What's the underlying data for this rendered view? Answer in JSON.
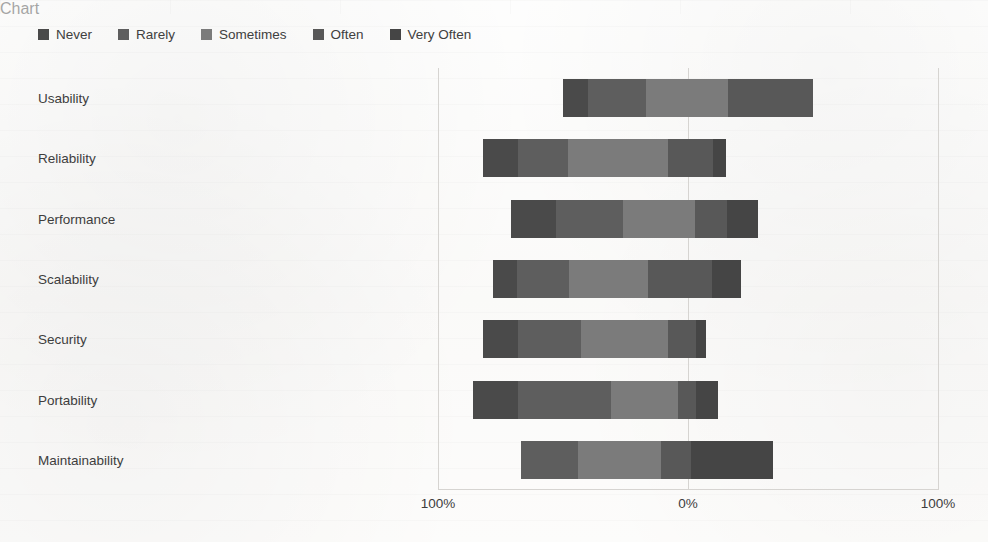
{
  "chart_data": {
    "type": "bar",
    "subtype": "diverging-stacked-likert",
    "title": "",
    "xlabel": "",
    "ylabel": "",
    "orientation": "horizontal",
    "stacked": true,
    "grid": true,
    "legend_position": "top-left",
    "xlim": [
      -100,
      100
    ],
    "xticks": [
      -100,
      0,
      100
    ],
    "xtick_labels": [
      "100%",
      "0%",
      "100%"
    ],
    "categories": [
      "Usability",
      "Reliability",
      "Performance",
      "Scalability",
      "Security",
      "Portability",
      "Maintainability"
    ],
    "legend": [
      {
        "label": "Never",
        "color": "#4a4a4a"
      },
      {
        "label": "Rarely",
        "color": "#5e5e5e"
      },
      {
        "label": "Sometimes",
        "color": "#7b7b7b"
      },
      {
        "label": "Often",
        "color": "#585858"
      },
      {
        "label": "Very Often",
        "color": "#454545"
      }
    ],
    "series": [
      {
        "name": "Never",
        "values": [
          10,
          14,
          20,
          10,
          14,
          18,
          0
        ]
      },
      {
        "name": "Rarely",
        "values": [
          23,
          20,
          30,
          22,
          25,
          37,
          23
        ]
      },
      {
        "name": "Sometimes",
        "values": [
          33,
          40,
          32,
          33,
          35,
          27,
          33
        ]
      },
      {
        "name": "Often",
        "values": [
          34,
          18,
          14,
          27,
          11,
          7,
          12
        ]
      },
      {
        "name": "Very Often",
        "values": [
          0,
          5,
          14,
          12,
          4,
          9,
          33
        ]
      }
    ],
    "bars": [
      {
        "category": "Usability",
        "start_pct": -50,
        "end_pct": 50,
        "segments": [
          {
            "label": "Never",
            "value": 10
          },
          {
            "label": "Rarely",
            "value": 23
          },
          {
            "label": "Sometimes",
            "value": 33
          },
          {
            "label": "Often",
            "value": 34
          },
          {
            "label": "Very Often",
            "value": 0
          }
        ]
      },
      {
        "category": "Reliability",
        "start_pct": -82,
        "end_pct": 17,
        "segments": [
          {
            "label": "Never",
            "value": 14
          },
          {
            "label": "Rarely",
            "value": 20
          },
          {
            "label": "Sometimes",
            "value": 40
          },
          {
            "label": "Often",
            "value": 18
          },
          {
            "label": "Very Often",
            "value": 5
          }
        ]
      },
      {
        "category": "Performance",
        "start_pct": -71,
        "end_pct": 28,
        "segments": [
          {
            "label": "Never",
            "value": 20
          },
          {
            "label": "Rarely",
            "value": 30
          },
          {
            "label": "Sometimes",
            "value": 32
          },
          {
            "label": "Often",
            "value": 14
          },
          {
            "label": "Very Often",
            "value": 14
          }
        ]
      },
      {
        "category": "Scalability",
        "start_pct": -78,
        "end_pct": 21,
        "segments": [
          {
            "label": "Never",
            "value": 10
          },
          {
            "label": "Rarely",
            "value": 22
          },
          {
            "label": "Sometimes",
            "value": 33
          },
          {
            "label": "Often",
            "value": 27
          },
          {
            "label": "Very Often",
            "value": 12
          }
        ]
      },
      {
        "category": "Security",
        "start_pct": -82,
        "end_pct": 16,
        "segments": [
          {
            "label": "Never",
            "value": 14
          },
          {
            "label": "Rarely",
            "value": 25
          },
          {
            "label": "Sometimes",
            "value": 35
          },
          {
            "label": "Often",
            "value": 11
          },
          {
            "label": "Very Often",
            "value": 4
          }
        ]
      },
      {
        "category": "Portability",
        "start_pct": -86,
        "end_pct": 13,
        "segments": [
          {
            "label": "Never",
            "value": 18
          },
          {
            "label": "Rarely",
            "value": 37
          },
          {
            "label": "Sometimes",
            "value": 27
          },
          {
            "label": "Often",
            "value": 7
          },
          {
            "label": "Very Often",
            "value": 9
          }
        ]
      },
      {
        "category": "Maintainability",
        "start_pct": -67,
        "end_pct": 34,
        "segments": [
          {
            "label": "Never",
            "value": 0
          },
          {
            "label": "Rarely",
            "value": 23
          },
          {
            "label": "Sometimes",
            "value": 33
          },
          {
            "label": "Often",
            "value": 12
          },
          {
            "label": "Very Often",
            "value": 33
          }
        ]
      }
    ]
  },
  "colors": {
    "never": "#4a4a4a",
    "rarely": "#5e5e5e",
    "sometimes": "#7b7b7b",
    "often": "#585858",
    "very_often": "#454545",
    "grid": "#d6d4d1",
    "text": "#3d3d3d",
    "background": "#fbfaf8"
  }
}
